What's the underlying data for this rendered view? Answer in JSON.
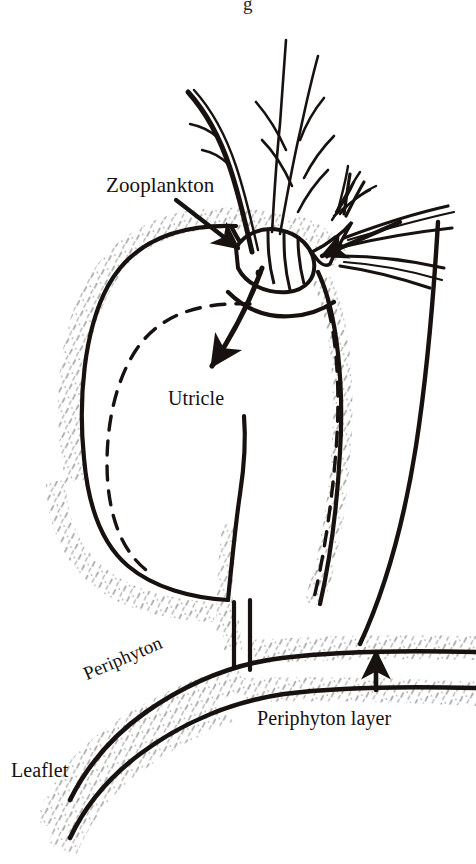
{
  "figure": {
    "type": "line-drawing-diagram",
    "background_color": "#ffffff",
    "ink_color": "#17110f",
    "stipple_color": "#9a9a9a",
    "width": 476,
    "height": 864
  },
  "labels": {
    "zooplankton": "Zooplankton",
    "utricle": "Utricle",
    "periphyton": "Periphyton",
    "periphyton_layer": "Periphyton layer",
    "leaflet": "Leaflet"
  },
  "cropped_caption_fragment": "g",
  "annotations": {
    "zooplankton_leader": "line from Zooplankton label down-right to trap mouth, solid arrowhead",
    "intake_arrow": "curved arrow entering the utricle mouth and pointing down-left into the trap lumen",
    "prey_arrow": "solid arrowhead pointing left toward the zooplankton body",
    "periphyton_arrow": "solid arrowhead pointing up into the periphyton layer"
  },
  "structures": [
    {
      "name": "utricle-body",
      "description": "large rounded bladder outlined in solid black with inner dashed wall"
    },
    {
      "name": "utricle-stalk",
      "description": "narrow stalk descending from the bladder to the leaflet"
    },
    {
      "name": "trap-mouth",
      "description": "opening at the upper right of the bladder with curved threshold"
    },
    {
      "name": "zooplankton",
      "description": "copepod-like crustacean with segmented body, eye spot, branched antennae and caudal setae"
    },
    {
      "name": "leaflet",
      "description": "curving leaf blade crossing the lower part of the figure"
    },
    {
      "name": "periphyton-layer",
      "description": "stippled band coating the leaflet and bladder surfaces"
    }
  ]
}
